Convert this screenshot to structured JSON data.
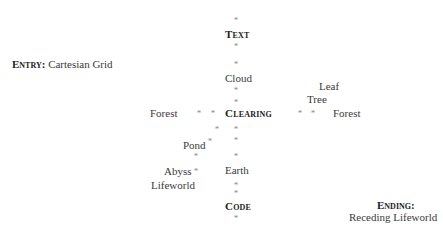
{
  "entry": {
    "label": "Entry:",
    "value": "Cartesian Grid"
  },
  "ending": {
    "label": "Ending:",
    "value": "Receding Lifeworld"
  },
  "nodes": {
    "text": "Text",
    "cloud": "Cloud",
    "clearing": "Clearing",
    "earth": "Earth",
    "code": "Code",
    "forest_left": "Forest",
    "forest_right": "Forest",
    "tree": "Tree",
    "leaf": "Leaf",
    "pond": "Pond",
    "abyss": "Abyss",
    "lifeworld": "Lifeworld"
  },
  "marker": "*"
}
